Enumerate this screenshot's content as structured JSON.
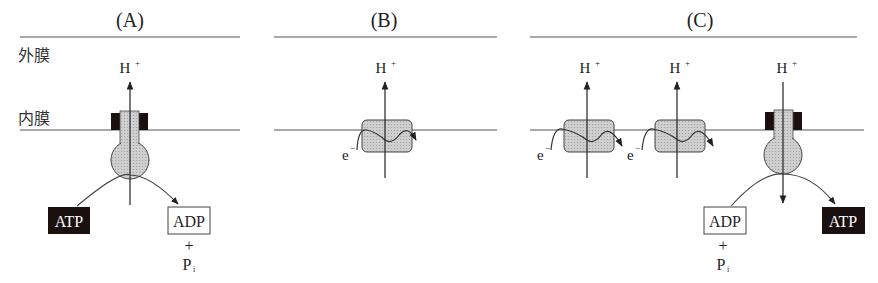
{
  "panels": [
    {
      "id": "A",
      "title": "(A)"
    },
    {
      "id": "B",
      "title": "(B)"
    },
    {
      "id": "C",
      "title": "(C)"
    }
  ],
  "labels": {
    "outer_membrane": "外膜",
    "inner_membrane": "内膜",
    "proton": "H",
    "proton_charge": "+",
    "electron": "e",
    "electron_charge": "−",
    "atp": "ATP",
    "adp": "ADP",
    "plus": "+",
    "phosphate": "P",
    "phosphate_sub": "i"
  },
  "colors": {
    "line": "#555555",
    "protein_fill": "#c8c8c8",
    "dark_box": "#1a1010",
    "text": "#222222"
  }
}
